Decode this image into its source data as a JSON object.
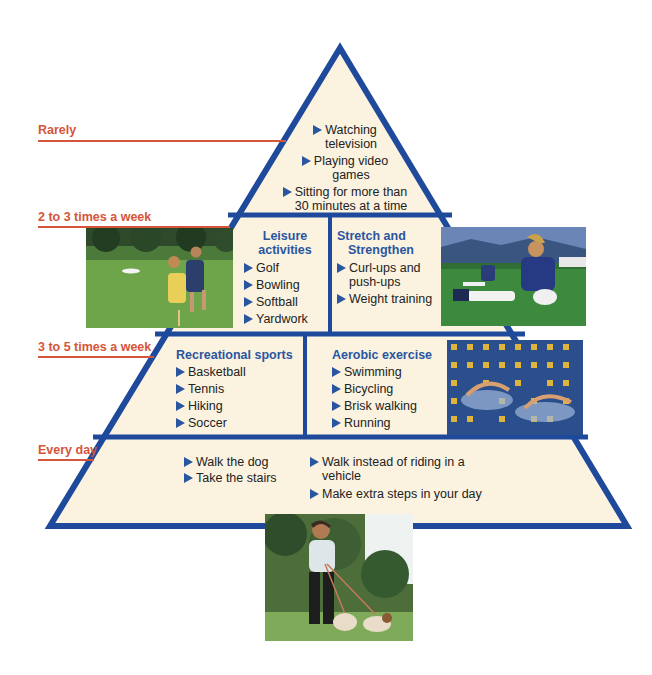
{
  "colors": {
    "frequency_label": "#d5553a",
    "pyramid_stroke": "#1f4a9c",
    "pyramid_fill": "#fbf2e0",
    "heading_blue": "#2a56a0",
    "bullet_blue": "#2a56a0"
  },
  "frequency_labels": {
    "rarely": "Rarely",
    "two_three": "2 to 3 times a week",
    "three_five": "3 to 5 times a week",
    "every_day": "Every day"
  },
  "tiers": {
    "top": {
      "items": [
        [
          "Watching",
          "television"
        ],
        [
          "Playing video",
          "games"
        ],
        [
          "Sitting for more than",
          "30 minutes at a time"
        ]
      ]
    },
    "leisure": {
      "heading": [
        "Leisure",
        "activities"
      ],
      "items": [
        "Golf",
        "Bowling",
        "Softball",
        "Yardwork"
      ]
    },
    "stretch": {
      "heading": [
        "Stretch and",
        "Strengthen"
      ],
      "items": [
        [
          "Curl-ups and",
          "push-ups"
        ],
        [
          "Weight training"
        ]
      ]
    },
    "recreational": {
      "heading": "Recreational sports",
      "items": [
        "Basketball",
        "Tennis",
        "Hiking",
        "Soccer"
      ]
    },
    "aerobic": {
      "heading": "Aerobic exercise",
      "items": [
        "Swimming",
        "Bicycling",
        "Brisk walking",
        "Running"
      ]
    },
    "everyday": {
      "left_items": [
        "Walk the dog",
        "Take the stairs"
      ],
      "right_items": [
        [
          "Walk instead of riding in a",
          "vehicle"
        ],
        [
          "Make extra steps in your day"
        ]
      ]
    }
  },
  "photos": {
    "frisbee": "people playing frisbee on grass",
    "stretching": "soccer players stretching on field",
    "swimming": "swimmers in pool lanes",
    "dog_walking": "woman walking two dogs"
  }
}
